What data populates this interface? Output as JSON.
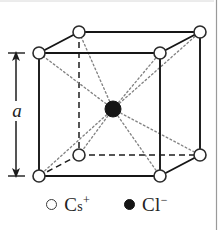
{
  "figure": {
    "background_color": "#ffffff",
    "border_color": "#b9b9b9",
    "dimension": {
      "label": "a",
      "name": "lattice-parameter",
      "orientation": "vertical",
      "arrow_color": "#1c1c1c"
    },
    "structure": {
      "shape": "cube",
      "edge_solid_color": "#161616",
      "edge_hidden_style": "dashed",
      "edge_hidden_color": "#1c1c1c",
      "bond_style": "dotted",
      "bond_color": "#7a7a7a",
      "vertices": [
        {
          "name": "front-bottom-left",
          "x": 39,
          "y": 176
        },
        {
          "name": "front-bottom-right",
          "x": 160,
          "y": 176
        },
        {
          "name": "front-top-right",
          "x": 160,
          "y": 53
        },
        {
          "name": "front-top-left",
          "x": 39,
          "y": 53
        },
        {
          "name": "back-bottom-left",
          "x": 79,
          "y": 155
        },
        {
          "name": "back-bottom-right",
          "x": 200,
          "y": 155
        },
        {
          "name": "back-top-right",
          "x": 200,
          "y": 32
        },
        {
          "name": "back-top-left",
          "x": 79,
          "y": 32
        }
      ],
      "center_atom": {
        "name": "body-center",
        "x": 113,
        "y": 109,
        "radius": 8
      },
      "corner_atom_radius": 6
    }
  },
  "legend": {
    "name": "ion-legend",
    "items": [
      {
        "marker": "open-circle",
        "element": "C",
        "element_small": "s",
        "charge": "+",
        "text": "Cs+",
        "color": "#ffffff",
        "outline": "#3a3a3a"
      },
      {
        "marker": "filled-circle",
        "element": "Cl",
        "element_small": "",
        "charge": "−",
        "text": "Cl−",
        "color": "#161616",
        "outline": "#161616"
      }
    ]
  }
}
